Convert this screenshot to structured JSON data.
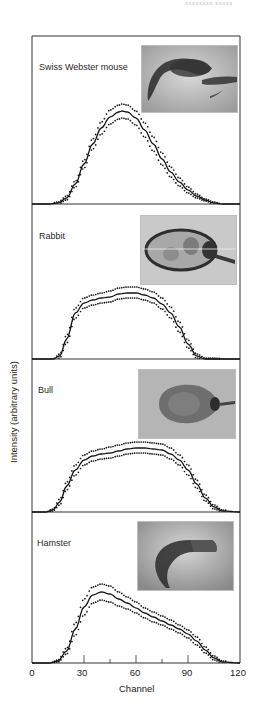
{
  "corner_text": "xxxxxxxx xxxxx",
  "chart_data": {
    "type": "line",
    "title": "",
    "xlabel": "Channel",
    "ylabel": "Intensity (arbitrary units)",
    "xlim": [
      0,
      120
    ],
    "x_ticks": [
      0,
      30,
      60,
      90,
      120
    ],
    "x_minor_ticks": [
      45,
      75
    ],
    "grid": false,
    "legend": null,
    "panels": [
      {
        "label": "Swiss Webster mouse",
        "image_alt": "Swiss Webster mouse sperm head micrograph",
        "x": [
          0,
          10,
          15,
          20,
          25,
          30,
          35,
          40,
          45,
          50,
          52,
          55,
          60,
          65,
          70,
          75,
          80,
          85,
          90,
          95,
          100,
          105,
          110,
          120
        ],
        "mean": [
          0,
          0,
          1,
          6,
          20,
          40,
          60,
          76,
          87,
          92,
          93,
          92,
          86,
          74,
          60,
          45,
          32,
          22,
          14,
          8,
          4,
          1,
          0,
          0
        ],
        "upper": [
          0,
          0,
          2,
          8,
          23,
          44,
          65,
          82,
          94,
          99,
          100,
          99,
          93,
          81,
          67,
          51,
          37,
          26,
          17,
          10,
          5,
          2,
          0,
          0
        ],
        "lower": [
          0,
          0,
          0,
          4,
          17,
          36,
          55,
          70,
          80,
          85,
          86,
          85,
          79,
          67,
          53,
          39,
          27,
          18,
          11,
          6,
          3,
          0,
          0,
          0
        ]
      },
      {
        "label": "Rabbit",
        "image_alt": "Rabbit sperm head micrograph",
        "x": [
          0,
          12,
          16,
          20,
          25,
          30,
          35,
          40,
          45,
          50,
          55,
          60,
          65,
          70,
          75,
          80,
          85,
          90,
          95,
          100,
          120
        ],
        "mean": [
          0,
          0,
          3,
          20,
          46,
          56,
          59,
          61,
          62,
          65,
          66,
          66,
          64,
          61,
          55,
          46,
          32,
          15,
          3,
          0,
          0
        ],
        "upper": [
          0,
          0,
          5,
          24,
          51,
          61,
          64,
          66,
          68,
          71,
          72,
          72,
          70,
          67,
          61,
          52,
          37,
          19,
          5,
          1,
          0
        ],
        "lower": [
          0,
          0,
          1,
          16,
          41,
          51,
          54,
          56,
          57,
          60,
          61,
          61,
          59,
          56,
          50,
          41,
          27,
          11,
          1,
          0,
          0
        ]
      },
      {
        "label": "Bull",
        "image_alt": "Bull sperm head micrograph",
        "x": [
          0,
          8,
          12,
          16,
          20,
          25,
          30,
          35,
          40,
          45,
          50,
          55,
          60,
          65,
          70,
          75,
          80,
          85,
          90,
          95,
          100,
          105,
          110,
          120
        ],
        "mean": [
          0,
          0,
          2,
          10,
          26,
          42,
          52,
          56,
          58,
          59,
          61,
          63,
          64,
          64,
          63,
          62,
          58,
          52,
          42,
          28,
          14,
          5,
          1,
          0
        ],
        "upper": [
          0,
          0,
          3,
          13,
          30,
          47,
          57,
          61,
          63,
          65,
          67,
          69,
          70,
          70,
          69,
          68,
          64,
          57,
          47,
          32,
          17,
          7,
          2,
          0
        ],
        "lower": [
          0,
          0,
          1,
          7,
          22,
          37,
          47,
          51,
          53,
          54,
          56,
          58,
          59,
          59,
          58,
          57,
          53,
          47,
          37,
          24,
          11,
          3,
          0,
          0
        ]
      },
      {
        "label": "Hamster",
        "image_alt": "Hamster sperm head micrograph",
        "x": [
          0,
          10,
          15,
          20,
          25,
          30,
          35,
          40,
          45,
          50,
          55,
          60,
          65,
          70,
          75,
          80,
          85,
          90,
          95,
          100,
          105,
          110,
          120
        ],
        "mean": [
          0,
          0,
          2,
          12,
          34,
          56,
          68,
          71,
          69,
          64,
          60,
          55,
          50,
          46,
          42,
          38,
          34,
          29,
          22,
          13,
          5,
          1,
          0
        ],
        "upper": [
          0,
          0,
          3,
          15,
          40,
          64,
          76,
          79,
          77,
          71,
          66,
          61,
          55,
          51,
          47,
          43,
          38,
          33,
          26,
          16,
          7,
          2,
          0
        ],
        "lower": [
          0,
          0,
          1,
          9,
          28,
          48,
          60,
          63,
          61,
          57,
          54,
          50,
          45,
          41,
          38,
          34,
          30,
          25,
          18,
          10,
          3,
          0,
          0
        ]
      }
    ]
  }
}
